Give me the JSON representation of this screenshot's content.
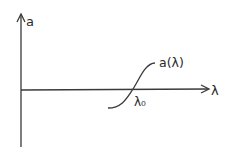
{
  "diagram": {
    "type": "function-sketch",
    "colors": {
      "stroke": "#3a3a3a",
      "text": "#2a2a2a",
      "background": "#ffffff"
    },
    "y_axis": {
      "label": "a"
    },
    "x_axis": {
      "label": "λ"
    },
    "curve": {
      "label": "a(λ)",
      "shape": "sigmoid crossing x-axis"
    },
    "crossing_point": {
      "label": "λ₀"
    }
  }
}
